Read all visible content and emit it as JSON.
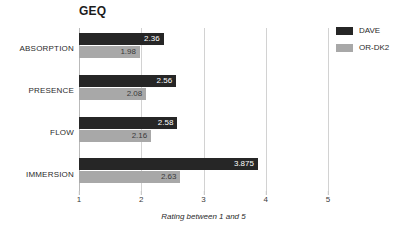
{
  "chart_data": {
    "type": "bar",
    "orientation": "horizontal",
    "title": "GEQ",
    "xlabel": "Rating between 1 and 5",
    "ylabel": "",
    "xlim": [
      1,
      5
    ],
    "xticks": [
      "1",
      "2",
      "3",
      "4",
      "5"
    ],
    "grid": true,
    "legend_position": "right",
    "categories": [
      "ABSORPTION",
      "PRESENCE",
      "FLOW",
      "IMMERSION"
    ],
    "series": [
      {
        "name": "DAVE",
        "color": "#262626",
        "values": [
          2.36,
          2.56,
          2.58,
          3.875
        ],
        "labels": [
          "2.36",
          "2.56",
          "2.58",
          "3.875"
        ]
      },
      {
        "name": "OR-DK2",
        "color": "#a8a8a8",
        "values": [
          1.98,
          2.08,
          2.16,
          2.63
        ],
        "labels": [
          "1.98",
          "2.08",
          "2.16",
          "2.63"
        ]
      }
    ]
  },
  "legend": {
    "items": [
      {
        "label": "DAVE",
        "color": "#262626"
      },
      {
        "label": "OR-DK2",
        "color": "#a8a8a8"
      }
    ]
  }
}
